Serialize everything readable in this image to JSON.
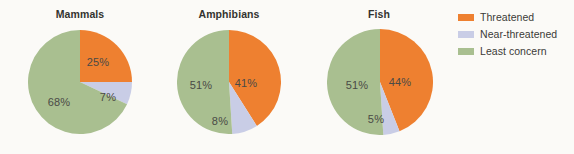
{
  "chart_data": {
    "type": "pie",
    "title": "",
    "categories": [
      "Threatened",
      "Near-threatened",
      "Least concern"
    ],
    "colors": [
      "#ee8030",
      "#c9cde6",
      "#a9bf90"
    ],
    "legend_position": "right",
    "units": "percent",
    "charts": [
      {
        "title": "Mammals",
        "values": [
          25,
          7,
          68
        ],
        "labels": [
          "25%",
          "7%",
          "68%"
        ]
      },
      {
        "title": "Amphibians",
        "values": [
          41,
          8,
          51
        ],
        "labels": [
          "41%",
          "8%",
          "51%"
        ]
      },
      {
        "title": "Fish",
        "values": [
          44,
          5,
          51
        ],
        "labels": [
          "44%",
          "5%",
          "51%"
        ]
      }
    ]
  },
  "legend": {
    "items": [
      {
        "label": "Threatened",
        "color": "#ee8030"
      },
      {
        "label": "Near-threatened",
        "color": "#c9cde6"
      },
      {
        "label": "Least concern",
        "color": "#a9bf90"
      }
    ]
  },
  "background": "#fbfaf7"
}
